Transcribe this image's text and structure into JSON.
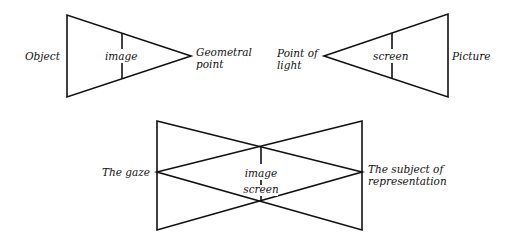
{
  "figures": {
    "top_left": {
      "left_label": "Object",
      "inner_label": "image",
      "apex_label_line1": "Geometral",
      "apex_label_line2": "point"
    },
    "top_right": {
      "apex_label_line1": "Point of",
      "apex_label_line2": "light",
      "inner_label": "screen",
      "right_label": "Picture"
    },
    "bottom": {
      "left_label": "The gaze",
      "center_label_line1": "image",
      "center_label_line2": "screen",
      "right_label_line1": "The subject of",
      "right_label_line2": "representation"
    }
  },
  "colors": {
    "stroke": "#111111",
    "background": "#ffffff"
  }
}
